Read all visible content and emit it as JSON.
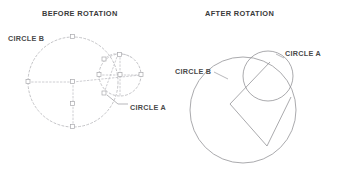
{
  "figure": {
    "background_color": "#ffffff",
    "line_color": "#b9b9bd",
    "solid_line_color": "#8e8e92",
    "text_color": "#3a3a3a"
  },
  "panels": [
    {
      "id": "before",
      "title": "BEFORE ROTATION",
      "title_x": 42,
      "title_y": 16,
      "labels": [
        {
          "name": "circle-b-label",
          "text": "CIRCLE B",
          "x": 8,
          "y": 41
        },
        {
          "name": "circle-a-label",
          "text": "CIRCLE A",
          "x": 130,
          "y": 110
        }
      ],
      "shapes": {
        "circle_b": {
          "cx": 73,
          "cy": 82,
          "r": 45,
          "style": "dashed"
        },
        "circle_a": {
          "cx": 120,
          "cy": 75,
          "r": 21,
          "style": "dashed"
        }
      }
    },
    {
      "id": "after",
      "title": "AFTER ROTATION",
      "title_x": 205,
      "title_y": 16,
      "labels": [
        {
          "name": "circle-b-label",
          "text": "CIRCLE B",
          "x": 175,
          "y": 74
        },
        {
          "name": "circle-a-label",
          "text": "CIRCLE A",
          "x": 285,
          "y": 56
        }
      ],
      "shapes": {
        "circle_b": {
          "cx": 243,
          "cy": 110,
          "r": 53,
          "style": "solid"
        },
        "circle_a": {
          "cx": 268,
          "cy": 76,
          "r": 25,
          "style": "solid"
        },
        "wedge": {
          "style": "solid"
        }
      }
    }
  ]
}
